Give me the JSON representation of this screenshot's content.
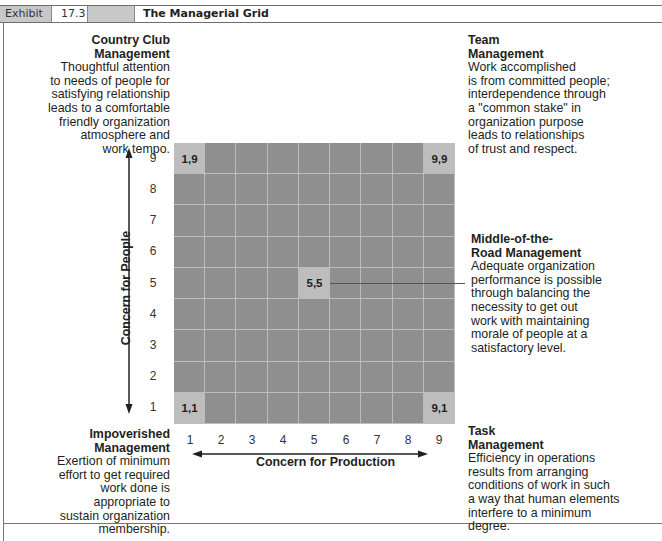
{
  "header": {
    "exhibit_label": "Exhibit",
    "exhibit_number": "17.3",
    "title": "The Managerial Grid"
  },
  "styles": {
    "header_gray": "#c8c8c8",
    "grid_cell": "#8f8f8f",
    "grid_highlight": "#bdbdbd",
    "grid_line": "#bdbdbd"
  },
  "styles_list": [
    {
      "id": "country-club",
      "coord": "1,9",
      "title_lines": [
        "Country Club",
        "Management"
      ],
      "body_lines": [
        "Thoughtful attention",
        "to needs of people for",
        "satisfying relationship",
        "leads to a comfortable",
        "friendly organization",
        "atmosphere and",
        "work tempo."
      ]
    },
    {
      "id": "team",
      "coord": "9,9",
      "title_lines": [
        "Team",
        "Management"
      ],
      "body_lines": [
        "Work accomplished",
        "is from committed people;",
        "interdependence through",
        "a \"common stake\" in",
        "organization purpose",
        "leads to relationships",
        "of trust and respect."
      ]
    },
    {
      "id": "middle-of-the-road",
      "coord": "5,5",
      "title_lines": [
        "Middle-of-the-",
        "Road Management"
      ],
      "body_lines": [
        "Adequate organization",
        "performance is possible",
        "through balancing the",
        "necessity to get out",
        "work with maintaining",
        "morale of people at a",
        "satisfactory level."
      ]
    },
    {
      "id": "impoverished",
      "coord": "1,1",
      "title_lines": [
        "Impoverished",
        "Management"
      ],
      "body_lines": [
        "Exertion of minimum",
        "effort to get required",
        "work done is",
        "appropriate to",
        "sustain organization",
        "membership."
      ]
    },
    {
      "id": "task",
      "coord": "9,1",
      "title_lines": [
        "Task",
        "Management"
      ],
      "body_lines": [
        "Efficiency in operations",
        "results from arranging",
        "conditions of work in such",
        "a way that human elements",
        "interfere to a minimum",
        "degree."
      ]
    }
  ],
  "axes": {
    "y_label": "Concern for People",
    "x_label": "Concern for Production",
    "y_ticks": [
      "9",
      "8",
      "7",
      "6",
      "5",
      "4",
      "3",
      "2",
      "1"
    ],
    "x_ticks": [
      "1",
      "2",
      "3",
      "4",
      "5",
      "6",
      "7",
      "8",
      "9"
    ]
  },
  "grid": {
    "size": 9,
    "highlighted_cells": [
      {
        "x": 1,
        "y": 9,
        "label": "1,9"
      },
      {
        "x": 9,
        "y": 9,
        "label": "9,9"
      },
      {
        "x": 5,
        "y": 5,
        "label": "5,5"
      },
      {
        "x": 1,
        "y": 1,
        "label": "1,1"
      },
      {
        "x": 9,
        "y": 1,
        "label": "9,1"
      }
    ]
  }
}
